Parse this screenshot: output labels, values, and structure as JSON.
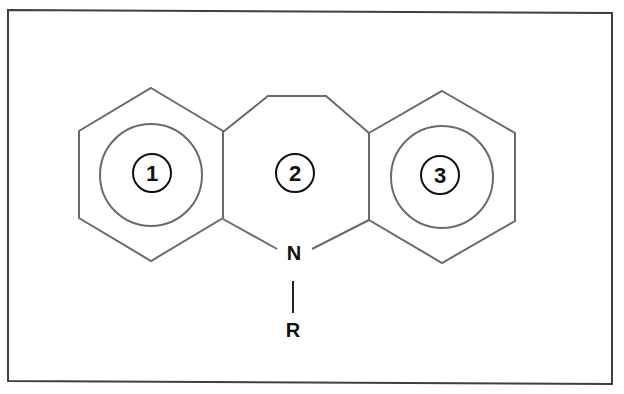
{
  "diagram": {
    "title": "",
    "type": "chemical-structure",
    "colors": {
      "frame": "#3f3f3f",
      "bonds": "#6a6a6a",
      "labels": "#111111",
      "background": "#ffffff"
    },
    "rings": [
      {
        "id": "ring-1",
        "label": "1",
        "kind": "benzene",
        "center": [
          151,
          175
        ]
      },
      {
        "id": "ring-2",
        "label": "2",
        "kind": "azepine",
        "center": [
          295,
          173
        ]
      },
      {
        "id": "ring-3",
        "label": "3",
        "kind": "benzene",
        "center": [
          442,
          177
        ]
      }
    ],
    "atoms": {
      "nitrogen": "N",
      "substituent": "R"
    }
  }
}
